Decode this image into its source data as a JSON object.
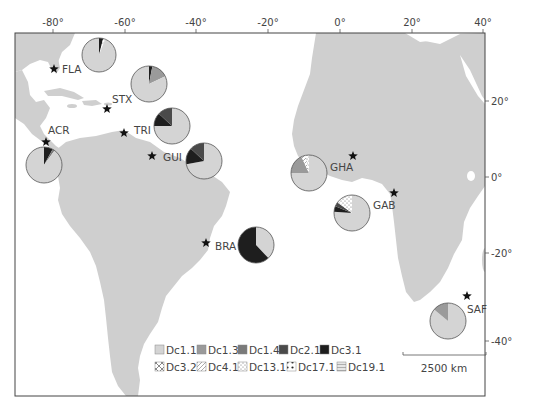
{
  "map": {
    "axes": {
      "x_ticks": [
        {
          "label": "-80°",
          "x": 53
        },
        {
          "label": "-60°",
          "x": 125
        },
        {
          "label": "-40°",
          "x": 196
        },
        {
          "label": "-20°",
          "x": 268
        },
        {
          "label": "0°",
          "x": 340
        },
        {
          "label": "20°",
          "x": 412
        },
        {
          "label": "40°",
          "x": 483
        }
      ],
      "y_ticks": [
        {
          "label": "20°",
          "y": 101
        },
        {
          "label": "0°",
          "y": 177
        },
        {
          "label": "-20°",
          "y": 253
        },
        {
          "label": "-40°",
          "y": 341
        }
      ]
    },
    "colors": {
      "land": "#cfcfcf",
      "ocean": "#ffffff",
      "frame": "#444444",
      "Dc1.1": "#d4d4d4",
      "Dc1.3": "#9a9a9a",
      "Dc1.4": "#7a7a7a",
      "Dc2.1": "#4a4a4a",
      "Dc3.1": "#1e1e1e"
    },
    "sites": [
      {
        "code": "FLA",
        "star": [
          54,
          69
        ],
        "label": [
          62,
          73
        ],
        "pie": {
          "cx": 99,
          "cy": 55,
          "r": 17,
          "slices": [
            {
              "hap": "Dc3.1",
              "pct": 4
            },
            {
              "hap": "Dc13.1",
              "pct": 2
            },
            {
              "hap": "Dc1.1",
              "pct": 94
            }
          ]
        }
      },
      {
        "code": "STX",
        "star": [
          107,
          109
        ],
        "label": [
          112,
          103
        ],
        "pie": {
          "cx": 149,
          "cy": 84,
          "r": 18,
          "slices": [
            {
              "hap": "Dc3.1",
              "pct": 3
            },
            {
              "hap": "Dc1.3",
              "pct": 15
            },
            {
              "hap": "Dc1.1",
              "pct": 82
            }
          ]
        }
      },
      {
        "code": "TRI",
        "star": [
          124,
          133
        ],
        "label": [
          134,
          134
        ],
        "pie": {
          "cx": 172,
          "cy": 126,
          "r": 18,
          "slices": [
            {
              "hap": "Dc1.1",
              "pct": 75
            },
            {
              "hap": "Dc3.1",
              "pct": 12
            },
            {
              "hap": "Dc2.1",
              "pct": 13
            }
          ]
        }
      },
      {
        "code": "GUI",
        "star": [
          152,
          156
        ],
        "label": [
          163,
          161
        ],
        "pie": {
          "cx": 204,
          "cy": 161,
          "r": 18,
          "slices": [
            {
              "hap": "Dc1.1",
              "pct": 72
            },
            {
              "hap": "Dc3.1",
              "pct": 15
            },
            {
              "hap": "Dc2.1",
              "pct": 13
            }
          ]
        }
      },
      {
        "code": "ACR",
        "star": [
          46,
          142
        ],
        "label": [
          48,
          134
        ],
        "pie": {
          "cx": 44,
          "cy": 165,
          "r": 18,
          "slices": [
            {
              "hap": "Dc3.1",
              "pct": 8
            },
            {
              "hap": "Dc1.4",
              "pct": 2
            },
            {
              "hap": "Dc1.1",
              "pct": 90
            }
          ]
        }
      },
      {
        "code": "BRA",
        "star": [
          206,
          243
        ],
        "label": [
          215,
          250
        ],
        "pie": {
          "cx": 256,
          "cy": 245,
          "r": 18,
          "slices": [
            {
              "hap": "Dc1.1",
              "pct": 38
            },
            {
              "hap": "Dc3.1",
              "pct": 62
            }
          ]
        }
      },
      {
        "code": "GHA",
        "star": [
          353,
          156
        ],
        "label": [
          330,
          171
        ],
        "pie": {
          "cx": 309,
          "cy": 173,
          "r": 18,
          "slices": [
            {
              "hap": "Dc1.1",
              "pct": 75
            },
            {
              "hap": "Dc1.3",
              "pct": 18
            },
            {
              "hap": "Dc4.1",
              "pct": 4
            },
            {
              "hap": "Dc13.1",
              "pct": 3
            }
          ]
        }
      },
      {
        "code": "GAB",
        "star": [
          394,
          193
        ],
        "label": [
          373,
          209
        ],
        "pie": {
          "cx": 352,
          "cy": 213,
          "r": 18,
          "slices": [
            {
              "hap": "Dc1.1",
              "pct": 76
            },
            {
              "hap": "Dc3.1",
              "pct": 5
            },
            {
              "hap": "Dc2.1",
              "pct": 4
            },
            {
              "hap": "Dc13.1",
              "pct": 15
            }
          ]
        }
      },
      {
        "code": "SAF",
        "star": [
          467,
          296
        ],
        "label": [
          467,
          313
        ],
        "pie": {
          "cx": 448,
          "cy": 321,
          "r": 18,
          "slices": [
            {
              "hap": "Dc1.1",
              "pct": 86
            },
            {
              "hap": "Dc1.3",
              "pct": 14
            }
          ]
        }
      }
    ],
    "legend": {
      "row1": [
        "Dc1.1",
        "Dc1.3",
        "Dc1.4",
        "Dc2.1",
        "Dc3.1"
      ],
      "row2": [
        "Dc3.2",
        "Dc4.1",
        "Dc13.1",
        "Dc17.1",
        "Dc19.1"
      ]
    },
    "scale_bar": {
      "label": "2500 km"
    }
  }
}
